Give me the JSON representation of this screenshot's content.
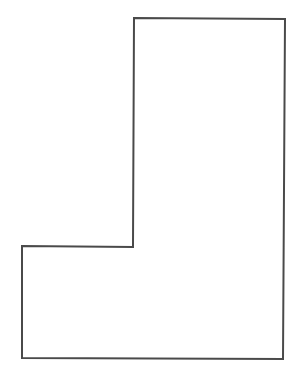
{
  "diagram": {
    "type": "polygon-outline",
    "shape": "L-shape",
    "stroke_color": "#4a4a4a",
    "fill_color": "#ffffff",
    "stroke_width": 2,
    "points": [
      [
        134,
        18
      ],
      [
        285,
        19
      ],
      [
        283,
        359
      ],
      [
        22,
        358
      ],
      [
        22,
        246
      ],
      [
        133,
        247
      ]
    ]
  }
}
